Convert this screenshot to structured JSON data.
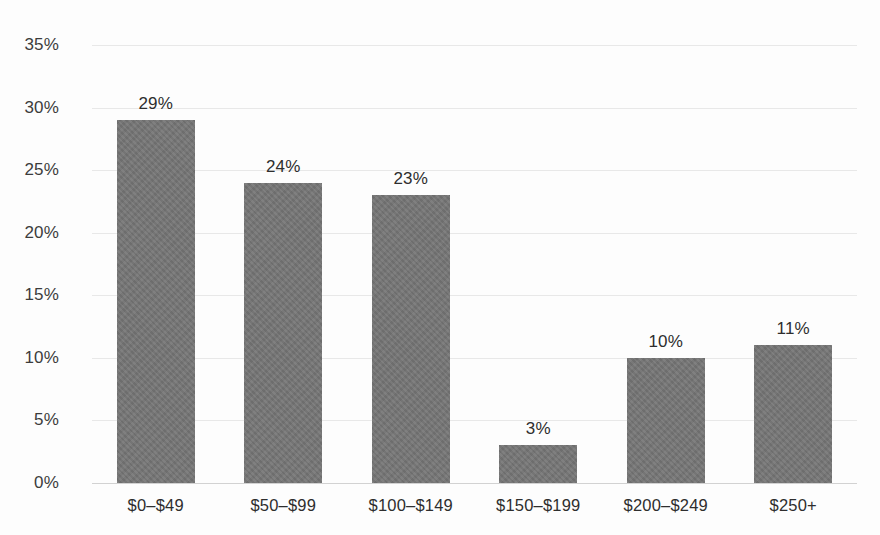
{
  "chart_data": {
    "type": "bar",
    "title": "",
    "subtitle": "",
    "xlabel": "",
    "ylabel": "",
    "categories": [
      "$0–$49",
      "$50–$99",
      "$100–$149",
      "$150–$199",
      "$200–$249",
      "$250+"
    ],
    "values": [
      29,
      24,
      23,
      3,
      10,
      11
    ],
    "data_labels": [
      "29%",
      "24%",
      "23%",
      "3%",
      "10%",
      "11%"
    ],
    "ylim": [
      0,
      35
    ],
    "ytick_values": [
      0,
      5,
      10,
      15,
      20,
      25,
      30,
      35
    ],
    "ytick_labels": [
      "0%",
      "5%",
      "10%",
      "15%",
      "20%",
      "25%",
      "30%",
      "35%"
    ],
    "grid": true,
    "grid_axis": "y",
    "legend": false,
    "legend_position": "none",
    "bar_color": "#767676",
    "gridline_color": "#e8e8e8",
    "axis_line_color": "#d2d2d2",
    "text_color": "#2e2e2e",
    "background_color": "#fdfdfd"
  }
}
